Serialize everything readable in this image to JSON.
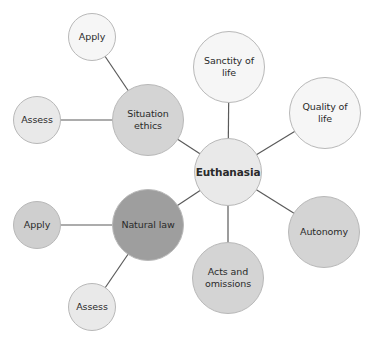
{
  "diagram": {
    "type": "mind-map",
    "center": {
      "id": "euthanasia",
      "label": "Euthanasia"
    },
    "nodes": {
      "euthanasia": {
        "label": "Euthanasia"
      },
      "sanctity_of_life": {
        "label": "Sanctity of life"
      },
      "quality_of_life": {
        "label": "Quality of life"
      },
      "autonomy": {
        "label": "Autonomy"
      },
      "acts_and_omissions": {
        "label": "Acts and omissions"
      },
      "natural_law": {
        "label": "Natural law"
      },
      "natural_law_apply": {
        "label": "Apply"
      },
      "natural_law_assess": {
        "label": "Assess"
      },
      "situation_ethics": {
        "label": "Situation ethics"
      },
      "situation_ethics_apply": {
        "label": "Apply"
      },
      "situation_ethics_assess": {
        "label": "Assess"
      }
    },
    "edges": [
      [
        "euthanasia",
        "sanctity_of_life"
      ],
      [
        "euthanasia",
        "quality_of_life"
      ],
      [
        "euthanasia",
        "autonomy"
      ],
      [
        "euthanasia",
        "acts_and_omissions"
      ],
      [
        "euthanasia",
        "natural_law"
      ],
      [
        "euthanasia",
        "situation_ethics"
      ],
      [
        "situation_ethics",
        "situation_ethics_apply"
      ],
      [
        "situation_ethics",
        "situation_ethics_assess"
      ],
      [
        "natural_law",
        "natural_law_apply"
      ],
      [
        "natural_law",
        "natural_law_assess"
      ]
    ],
    "colors": {
      "line": "#5a5a5a",
      "node_border": "#b8b8b8",
      "white_fill": "#f6f6f6",
      "light_fill": "#e9e9e9",
      "mid_fill": "#d4d4d4",
      "dark_fill": "#9e9e9e"
    }
  }
}
